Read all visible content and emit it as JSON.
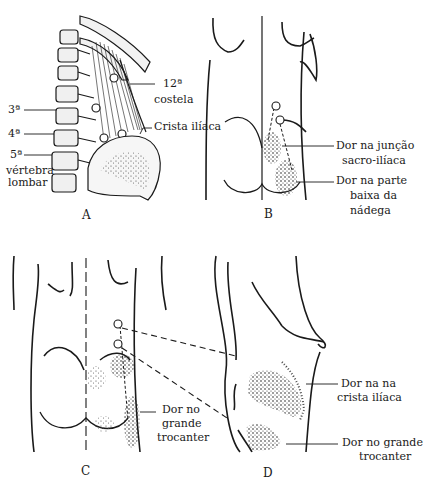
{
  "panels": {
    "A": {
      "letter": "A",
      "labels": {
        "rib": "12ª",
        "rib2": "costela",
        "crest": "Crista ilíaca",
        "v3": "3ª",
        "v4": "4ª",
        "v5": "5ª",
        "vert1": "vértebra",
        "vert2": "lombar"
      }
    },
    "B": {
      "letter": "B",
      "labels": {
        "sij1": "Dor na junção",
        "sij2": "sacro-ilíaca",
        "low1": "Dor na parte",
        "low2": "baixa da",
        "low3": "nádega"
      }
    },
    "C": {
      "letter": "C",
      "labels": {
        "gt1": "Dor no",
        "gt2": "grande",
        "gt3": "trocanter"
      }
    },
    "D": {
      "letter": "D",
      "labels": {
        "crest1": "Dor na na",
        "crest2": "crista ilíaca",
        "gt1": "Dor no grande",
        "gt2": "trocanter"
      }
    }
  },
  "colors": {
    "ink": "#1a1a1a",
    "background": "#ffffff"
  }
}
